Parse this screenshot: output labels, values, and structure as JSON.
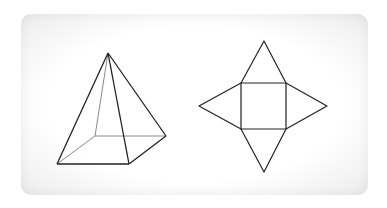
{
  "diagram": {
    "card_color": "#ffffff",
    "edge_color": "#222222",
    "hidden_edge_color": "#888888",
    "pyramid": {
      "apex": [
        108,
        53
      ],
      "base_front_left": [
        57,
        164
      ],
      "base_front_right": [
        129,
        164
      ],
      "base_back_right": [
        166,
        136
      ],
      "base_back_left_hidden": [
        95,
        136
      ]
    },
    "net": {
      "square": [
        241,
        83,
        286,
        129
      ],
      "top_apex": [
        264,
        41
      ],
      "left_apex": [
        199,
        106
      ],
      "right_apex": [
        327,
        106
      ],
      "bottom_apex": [
        264,
        172
      ]
    }
  }
}
